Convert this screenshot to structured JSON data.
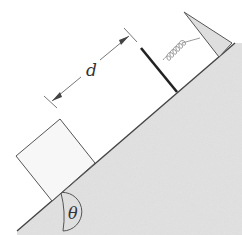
{
  "diagram": {
    "labels": {
      "distance": "d",
      "angle": "θ"
    },
    "elements": {
      "incline": "inclined plane at angle θ",
      "block": "block resting on incline",
      "barrier": "plate attached to spring",
      "spring": "spring",
      "stopper": "wedge stop at top of incline"
    },
    "colors": {
      "incline_fill": "#d9d9d9",
      "stroke": "#444444",
      "block_fill": "#f7f7f7",
      "spring": "#9a9a9a",
      "barrier": "#222222"
    }
  }
}
